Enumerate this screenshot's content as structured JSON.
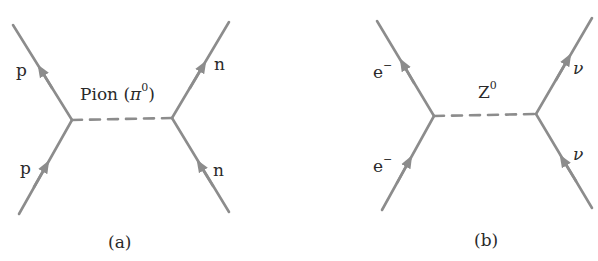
{
  "colors": {
    "line": "#8c8c8c",
    "text": "#2a2a2a",
    "background": "#ffffff"
  },
  "diagrams": [
    {
      "id": "a",
      "caption": "(a)",
      "mediator": {
        "label": "Pion (",
        "symbol": "π",
        "superscript": "0",
        "close": ")"
      },
      "particles": {
        "top_left": "p",
        "bottom_left": "p",
        "top_right": "n",
        "bottom_right": "n"
      }
    },
    {
      "id": "b",
      "caption": "(b)",
      "mediator": {
        "label": "Z",
        "superscript": "0"
      },
      "particles": {
        "top_left": "e",
        "top_left_sup": "−",
        "bottom_left": "e",
        "bottom_left_sup": "−",
        "top_right": "ν",
        "bottom_right": "ν"
      }
    }
  ]
}
